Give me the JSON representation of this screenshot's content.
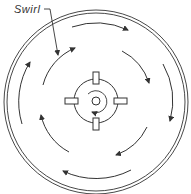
{
  "diagram": {
    "labels": {
      "swirl": "Swirl"
    },
    "colors": {
      "stroke": "#333333",
      "background": "#ffffff"
    },
    "components": [
      "outer-double-ring",
      "outer-orbit-arrows-clockwise",
      "inner-orbit-arrows-clockwise",
      "central-hub-with-four-tabs",
      "center-small-circle",
      "center-swirl-arrow"
    ]
  }
}
